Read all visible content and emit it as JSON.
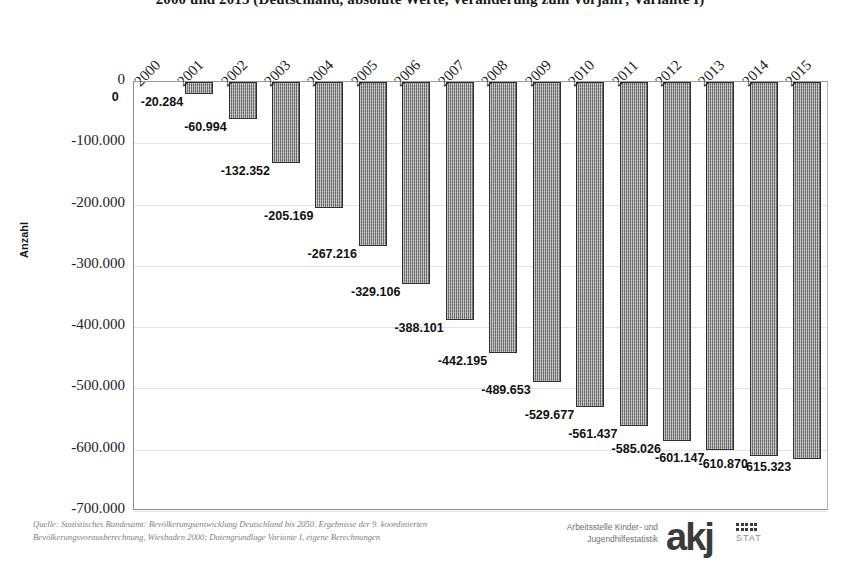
{
  "chart_data": {
    "type": "bar",
    "title": "2000 und 2015 (Deutschland, absolute Werte, Veränderung zum Vorjahr; Variante I)",
    "xlabel": "",
    "ylabel": "Anzahl",
    "ylim": [
      -700000,
      0
    ],
    "ytick_labels": [
      "0",
      "-100.000",
      "-200.000",
      "-300.000",
      "-400.000",
      "-500.000",
      "-600.000",
      "-700.000"
    ],
    "ytick_values": [
      0,
      -100000,
      -200000,
      -300000,
      -400000,
      -500000,
      -600000,
      -700000
    ],
    "grid": true,
    "legend": "none",
    "categories": [
      "2000",
      "2001",
      "2002",
      "2003",
      "2004",
      "2005",
      "2006",
      "2007",
      "2008",
      "2009",
      "2010",
      "2011",
      "2012",
      "2013",
      "2014",
      "2015"
    ],
    "values": [
      0,
      -20284,
      -60994,
      -132352,
      -205169,
      -267216,
      -329106,
      -388101,
      -442195,
      -489653,
      -529677,
      -561437,
      -585026,
      -601147,
      -610870,
      -615323
    ],
    "value_labels": [
      "0",
      "-20.284",
      "-60.994",
      "-132.352",
      "-205.169",
      "-267.216",
      "-329.106",
      "-388.101",
      "-442.195",
      "-489.653",
      "-529.677",
      "-561.437",
      "-585.026",
      "-601.147",
      "-610.870",
      "-615.323"
    ],
    "bar_color": "#8f8f8f",
    "bar_border_color": "#2f2f2f"
  },
  "source": {
    "line1": "Quelle: Statistisches Bundesamt: Bevölkerungsentwicklung Deutschland bis 2050. Ergebnisse der 9. koordinierten",
    "line2": "Bevölkerungsvorausberechnung, Wiesbaden 2000; Datengrundlage Variante I, eigene Berechnungen"
  },
  "logo": {
    "line1": "Arbeitsstelle Kinder- und",
    "line2": "Jugendhilfestatistik",
    "mark": "akj",
    "mark_suffix": "STAT"
  }
}
